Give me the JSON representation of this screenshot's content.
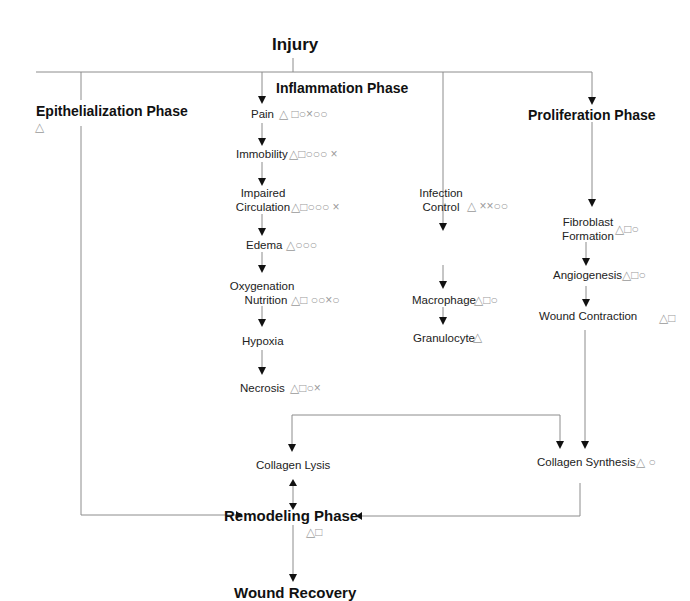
{
  "diagram": {
    "title": "Injury",
    "final": "Wound Recovery",
    "legend_symbols": {
      "triangle": "△",
      "square": "□",
      "circle": "○",
      "double_circle": "○○",
      "cross": "×",
      "double_cross": "××"
    },
    "phases": {
      "epithelialization": {
        "label": "Epithelialization Phase",
        "symbols": "△"
      },
      "inflammation": {
        "label": "Inflammation Phase"
      },
      "proliferation": {
        "label": "Proliferation Phase"
      },
      "remodeling": {
        "label": "Remodeling Phase",
        "symbols": "△□"
      }
    },
    "inflammation_chain": [
      {
        "line1": "Pain",
        "line2": "",
        "symbols": "△ □○×○○"
      },
      {
        "line1": "Immobility",
        "line2": "",
        "symbols": "△□○○○ ×"
      },
      {
        "line1": "Impaired",
        "line2": "Circulation",
        "symbols": "△□○○○ ×"
      },
      {
        "line1": "Edema",
        "line2": "",
        "symbols": "△○○○"
      },
      {
        "line1": "Oxygenation",
        "line2": "Nutrition",
        "symbols": "△□ ○○×○"
      },
      {
        "line1": "Hypoxia",
        "line2": "",
        "symbols": ""
      },
      {
        "line1": "Necrosis",
        "line2": "",
        "symbols": "△□○×"
      }
    ],
    "infection_chain": [
      {
        "line1": "Infection",
        "line2": "Control",
        "symbols": "△ ××○○"
      },
      {
        "line1": "Macrophage",
        "line2": "",
        "symbols": "△□○"
      },
      {
        "line1": "Granulocyte",
        "line2": "",
        "symbols": "△"
      }
    ],
    "proliferation_chain": [
      {
        "line1": "Fibroblast",
        "line2": "Formation",
        "symbols": "△□○"
      },
      {
        "line1": "Angiogenesis",
        "line2": "",
        "symbols": "△□○"
      },
      {
        "line1": "Wound Contraction",
        "line2": "",
        "symbols": "△□"
      }
    ],
    "collagen": {
      "lysis": {
        "label": "Collagen Lysis"
      },
      "synthesis": {
        "label": "Collagen Synthesis",
        "symbols": "△ ○"
      }
    },
    "colors": {
      "line": "#8c8c8c",
      "arrowhead": "#111111",
      "symbol": "#9a9a9a",
      "text": "#222222"
    }
  }
}
